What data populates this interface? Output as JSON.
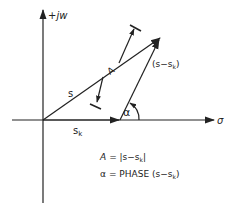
{
  "diagram": {
    "axes": {
      "vertical_label": "+jw",
      "horizontal_label": "σ"
    },
    "vectors": {
      "s_label": "s",
      "sk_label": "s",
      "sk_sub": "k",
      "diff_label_prefix": "(s−s",
      "diff_label_sub": "k",
      "diff_label_suffix": ")"
    },
    "dimension": {
      "magnitude_label": "A"
    },
    "angle": {
      "label": "α"
    },
    "equations": {
      "magnitude": {
        "lhs": "A",
        "rhs_prefix": "= |s−s",
        "rhs_sub": "k",
        "rhs_suffix": "|"
      },
      "phase": {
        "lhs": "α",
        "rhs_prefix": "= PHASE (s−s",
        "rhs_sub": "k",
        "rhs_suffix": ")"
      }
    },
    "colors": {
      "line": "#222222",
      "background": "#ffffff"
    }
  }
}
